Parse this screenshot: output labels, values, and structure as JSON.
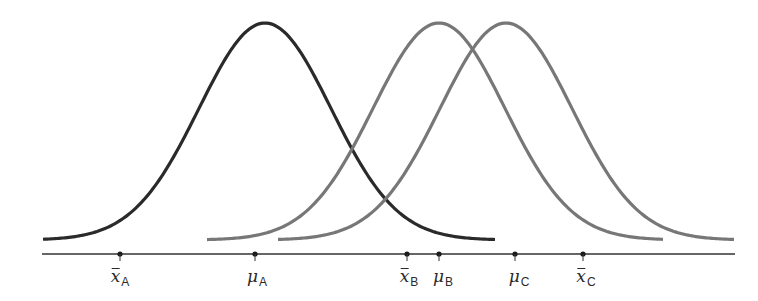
{
  "chart_data": {
    "type": "line",
    "title": "",
    "grid": false,
    "axis": {
      "x_start_px": 42,
      "x_end_px": 735,
      "y_px": 254,
      "color": "#333333"
    },
    "series": [
      {
        "name": "A",
        "color": "#2a2a2a",
        "peak_x_px": 265,
        "start_x_px": 43,
        "end_x_px": 496,
        "sigma_px": 66
      },
      {
        "name": "B",
        "color": "#777777",
        "peak_x_px": 439,
        "start_x_px": 207,
        "end_x_px": 663,
        "sigma_px": 66
      },
      {
        "name": "C",
        "color": "#777777",
        "peak_x_px": 506,
        "start_x_px": 278,
        "end_x_px": 734,
        "sigma_px": 66
      }
    ],
    "points": [
      {
        "id": "xbar_A",
        "symbol": "x",
        "overbar": true,
        "subscript": "A",
        "x_px": 120
      },
      {
        "id": "mu_A",
        "symbol": "μ",
        "overbar": false,
        "subscript": "A",
        "x_px": 255
      },
      {
        "id": "xbar_B",
        "symbol": "x",
        "overbar": true,
        "subscript": "B",
        "x_px": 407
      },
      {
        "id": "mu_B",
        "symbol": "μ",
        "overbar": false,
        "subscript": "B",
        "x_px": 439
      },
      {
        "id": "mu_C",
        "symbol": "μ",
        "overbar": false,
        "subscript": "C",
        "x_px": 515
      },
      {
        "id": "xbar_C",
        "symbol": "x",
        "overbar": true,
        "subscript": "C",
        "x_px": 583
      }
    ]
  },
  "labels": {
    "xbar_A": {
      "sym": "x",
      "sub": "A"
    },
    "mu_A": {
      "sym": "μ",
      "sub": "A"
    },
    "xbar_B": {
      "sym": "x",
      "sub": "B"
    },
    "mu_B": {
      "sym": "μ",
      "sub": "B"
    },
    "mu_C": {
      "sym": "μ",
      "sub": "C"
    },
    "xbar_C": {
      "sym": "x",
      "sub": "C"
    }
  }
}
